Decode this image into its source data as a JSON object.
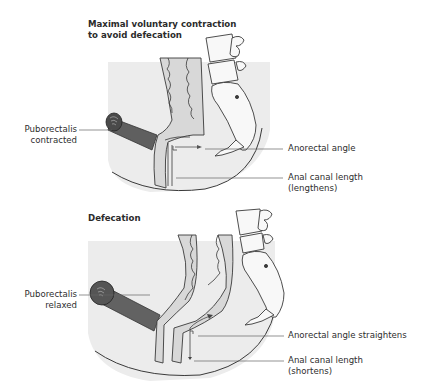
{
  "figure": {
    "panels": [
      {
        "id": "contraction",
        "title": "Maximal voluntary contraction\nto avoid defecation",
        "labels": {
          "puborectalis": "Puborectalis\ncontracted",
          "anorectal_angle": "Anorectal angle",
          "anal_canal": "Anal canal length\n(lengthens)"
        }
      },
      {
        "id": "defecation",
        "title": "Defecation",
        "labels": {
          "puborectalis": "Puborectalis\nrelaxed",
          "anorectal_angle": "Anorectal angle straightens",
          "anal_canal": "Anal canal length\n(shortens)"
        }
      }
    ],
    "colors": {
      "background_region": "#ebebeb",
      "rectal_wall": "#d6d6d6",
      "muscle": "#5a5a5a",
      "bone": "#f7f7f7",
      "outline": "#3a3a3a",
      "leader_line": "#666666"
    }
  }
}
